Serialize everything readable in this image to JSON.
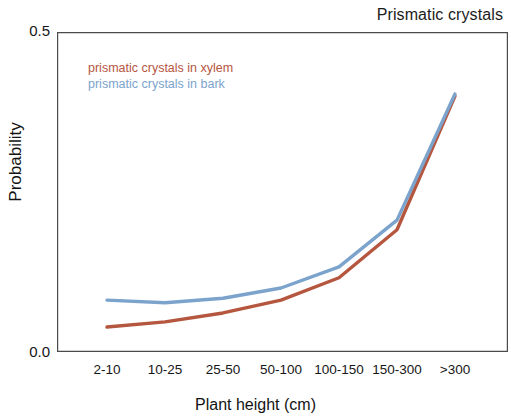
{
  "chart_data": {
    "type": "line",
    "title": "Prismatic crystals",
    "xlabel": "Plant height (cm)",
    "ylabel": "Probability",
    "categories": [
      "2-10",
      "10-25",
      "25-50",
      "50-100",
      "100-150",
      "150-300",
      ">300"
    ],
    "ylim": [
      0.0,
      0.5
    ],
    "ytick_labels": [
      "0.0",
      "0.5"
    ],
    "ytick_values": [
      0.0,
      0.5
    ],
    "grid": false,
    "legend_position": "upper-left-inside",
    "series": [
      {
        "name": "prismatic crystals in xylem",
        "color": "#b5563f",
        "values": [
          0.039,
          0.047,
          0.061,
          0.081,
          0.116,
          0.191,
          0.4
        ]
      },
      {
        "name": "prismatic crystals in bark",
        "color": "#7ba3cc",
        "values": [
          0.081,
          0.077,
          0.084,
          0.1,
          0.133,
          0.206,
          0.403
        ]
      }
    ]
  },
  "axis_color": "#4a4a4a"
}
